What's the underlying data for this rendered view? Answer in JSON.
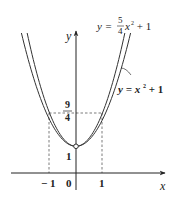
{
  "diagram": {
    "axes": {
      "x_label": "x",
      "y_label": "y",
      "origin_label": "0"
    },
    "ticks": {
      "x_neg_one": "− 1",
      "x_one": "1",
      "y_one": "1",
      "y_nine_fourths_num": "9",
      "y_nine_fourths_den": "4"
    },
    "curves": [
      {
        "name": "inner",
        "label_prefix": "y = ",
        "label_num": "5",
        "label_den": "4",
        "label_suffix": "x",
        "label_exp": "2",
        "label_tail": " + 1",
        "a": 1.25,
        "c": 1
      },
      {
        "name": "outer",
        "label_prefix": "y = x",
        "label_exp": "2",
        "label_tail": " + 1",
        "a": 1,
        "c": 1
      }
    ],
    "vertex": {
      "x": 0,
      "y": 1,
      "open": true
    },
    "guides": {
      "y_value": "9/4",
      "x_values": [
        -1,
        1
      ]
    },
    "colors": {
      "stroke": "#333333",
      "background": "#ffffff"
    }
  }
}
